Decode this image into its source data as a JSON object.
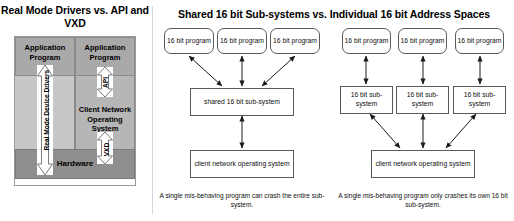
{
  "left_panel": {
    "title": "Real Mode Drivers vs. API and VXD",
    "app_box_left": "Application Program",
    "app_box_right": "Application Program",
    "client_os": "Client Network Operating System",
    "hardware": "Hardware",
    "arrow_real_mode": "Real Mode Device Drivers",
    "arrow_api": "API",
    "arrow_vxd": "VXD"
  },
  "right_panel": {
    "title": "Shared 16 bit Sub-systems vs. Individual 16 bit Address Spaces",
    "shared": {
      "programs": [
        "16 bit program",
        "16 bit program",
        "16 bit program"
      ],
      "subsystem": "shared 16 bit sub-system",
      "client_os": "client network operating system",
      "caption": "A single mis-behaving program can crash the entire sub-system."
    },
    "individual": {
      "programs": [
        "16 bit program",
        "16 bit program",
        "16 bit program"
      ],
      "subsystems": [
        "16 bit sub-system",
        "16 bit sub-system",
        "16 bit sub-system"
      ],
      "client_os": "client network operating system",
      "caption": "A single mis-behaving program only crashes its own 16 bit sub-system."
    }
  },
  "colors": {
    "app_box_fill": "#a9a9a9",
    "client_os_fill": "#b6b6b6",
    "left_column_fill": "#c7c7c7",
    "hardware_fill": "#8f8f8f",
    "node_border": "#5a5a5a",
    "arrow_fill": "#ffffff"
  }
}
